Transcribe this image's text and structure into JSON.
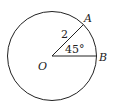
{
  "diagram": {
    "type": "circle-sector",
    "center": {
      "label": "O",
      "x": 52,
      "y": 56
    },
    "radius_px": 45,
    "points": [
      {
        "label": "A",
        "x": 84,
        "y": 24
      },
      {
        "label": "B",
        "x": 97,
        "y": 56
      }
    ],
    "radius_label": "2",
    "angle_label": "45°",
    "stroke_color": "#222222"
  }
}
